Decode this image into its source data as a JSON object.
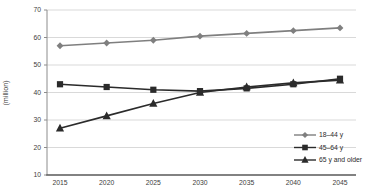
{
  "chart_data": {
    "type": "line",
    "title": "",
    "xlabel": "",
    "ylabel": "(million)",
    "x": [
      "2015",
      "2020",
      "2025",
      "2030",
      "2035",
      "2040",
      "2045"
    ],
    "series": [
      {
        "name": "18–44 y",
        "marker": "diamond",
        "color": "#7f7f7f",
        "values": [
          57,
          58,
          59,
          60.5,
          61.5,
          62.5,
          63.5
        ]
      },
      {
        "name": "45–64 y",
        "marker": "square",
        "color": "#2b2b2b",
        "values": [
          43,
          42,
          41,
          40.5,
          41.5,
          43,
          45
        ]
      },
      {
        "name": "65 y and older",
        "marker": "triangle",
        "color": "#2b2b2b",
        "values": [
          27,
          31.5,
          36,
          40,
          42,
          43.5,
          44.5
        ]
      }
    ],
    "ylim": [
      10,
      70
    ],
    "yticks": [
      10,
      20,
      30,
      40,
      50,
      60,
      70
    ],
    "grid": "horizontal",
    "legend_position": "inside-bottom-right",
    "colors": {
      "background": "#ffffff",
      "gridline": "#d9d9d9",
      "x_axis": "#595959",
      "y_axis": "#8c8c8c",
      "tick_text": "#3d3d3d",
      "legend_text": "#2b2b2b"
    }
  }
}
